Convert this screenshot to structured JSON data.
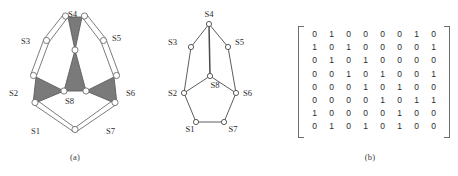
{
  "figure": {
    "panels": [
      {
        "id": "a",
        "caption": "(a)"
      },
      {
        "id": "b",
        "caption": "(b)"
      },
      {
        "id": "c",
        "caption": "(c)"
      }
    ]
  },
  "graph": {
    "node_labels": [
      "S1",
      "S2",
      "S3",
      "S4",
      "S5",
      "S6",
      "S7",
      "S8"
    ],
    "nodes_b": [
      {
        "label": "S1",
        "x": 46,
        "y": 122
      },
      {
        "label": "S2",
        "x": 34,
        "y": 93
      },
      {
        "label": "S3",
        "x": 41,
        "y": 47
      },
      {
        "label": "S4",
        "x": 59,
        "y": 24
      },
      {
        "label": "S5",
        "x": 78,
        "y": 47
      },
      {
        "label": "S6",
        "x": 86,
        "y": 93
      },
      {
        "label": "S7",
        "x": 74,
        "y": 122
      },
      {
        "label": "S8",
        "x": 60,
        "y": 76
      }
    ],
    "edges": [
      [
        "S1",
        "S2"
      ],
      [
        "S1",
        "S7"
      ],
      [
        "S2",
        "S3"
      ],
      [
        "S2",
        "S8"
      ],
      [
        "S3",
        "S4"
      ],
      [
        "S4",
        "S5"
      ],
      [
        "S4",
        "S8"
      ],
      [
        "S5",
        "S6"
      ],
      [
        "S6",
        "S7"
      ],
      [
        "S6",
        "S8"
      ]
    ],
    "edge_labels_a": [
      "S1",
      "S2",
      "S3",
      "S4",
      "S5",
      "S6",
      "S7",
      "S8"
    ]
  },
  "matrix": {
    "rows": [
      [
        0,
        1,
        0,
        0,
        0,
        0,
        1,
        0
      ],
      [
        1,
        0,
        1,
        0,
        0,
        0,
        0,
        1
      ],
      [
        0,
        1,
        0,
        1,
        0,
        0,
        0,
        0
      ],
      [
        0,
        0,
        1,
        0,
        1,
        0,
        0,
        1
      ],
      [
        0,
        0,
        0,
        1,
        0,
        1,
        0,
        0
      ],
      [
        0,
        0,
        0,
        0,
        1,
        0,
        1,
        1
      ],
      [
        1,
        0,
        0,
        0,
        0,
        1,
        0,
        0
      ],
      [
        0,
        1,
        0,
        1,
        0,
        1,
        0,
        0
      ]
    ]
  },
  "labels_a": {
    "S1": {
      "x": 31,
      "y": 134
    },
    "S2": {
      "x": 10,
      "y": 96
    },
    "S3": {
      "x": 21,
      "y": 44
    },
    "S4": {
      "x": 68,
      "y": 17
    },
    "S5": {
      "x": 113,
      "y": 40
    },
    "S6": {
      "x": 126,
      "y": 96
    },
    "S7": {
      "x": 106,
      "y": 134
    },
    "S8": {
      "x": 68,
      "y": 104
    }
  },
  "colors": {
    "ink": "#2b2b2b",
    "line": "#6d6d6d",
    "shade": "#7a7a7a",
    "node_fill": "#ffffff",
    "background": "#ffffff"
  }
}
